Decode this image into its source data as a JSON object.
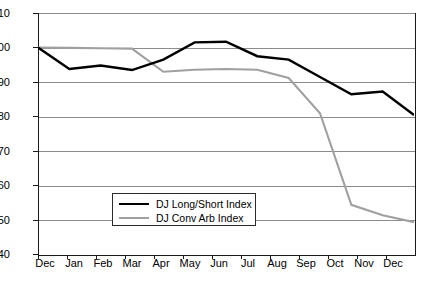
{
  "chart_data": {
    "type": "line",
    "title": "",
    "subtitle": "",
    "xlabel": "",
    "ylabel": "",
    "categories": [
      "Dec",
      "Jan",
      "Feb",
      "Mar",
      "Apr",
      "May",
      "Jun",
      "Jul",
      "Aug",
      "Sep",
      "Oct",
      "Nov",
      "Dec"
    ],
    "ylim": [
      40,
      110
    ],
    "ytick_values": [
      40,
      50,
      60,
      70,
      80,
      90,
      100,
      110
    ],
    "ytick_labels": [
      "40",
      "50",
      "60",
      "70",
      "80",
      "90",
      "100",
      "110"
    ],
    "grid": true,
    "legend_position": "inside-lower-left",
    "series": [
      {
        "name": "DJ Long/Short Index",
        "color": "#000000",
        "values": [
          100,
          93.8,
          94.8,
          93.5,
          96.5,
          101.5,
          101.7,
          97.5,
          96.5,
          91.5,
          86.5,
          87.3,
          80.5
        ]
      },
      {
        "name": "DJ Conv Arb Index",
        "color": "#a0a0a0",
        "values": [
          100,
          99.9,
          99.8,
          99.7,
          93.0,
          93.6,
          93.8,
          93.6,
          91.2,
          81.0,
          54.5,
          51.5,
          49.5
        ]
      }
    ]
  },
  "legend": {
    "entries": [
      {
        "label": "DJ Long/Short Index"
      },
      {
        "label": "DJ Conv Arb Index"
      }
    ]
  }
}
